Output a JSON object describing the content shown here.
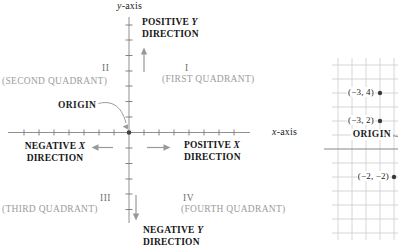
{
  "figure": "rectangular-coordinate-system-diagram",
  "colors": {
    "text": "#1c1c1c",
    "muted_label": "#9c9c9c",
    "numeral": "#6e6e6e",
    "axis_line": "#909090",
    "arrow": "#999999",
    "grid_line": "#cccccc",
    "grid_axis": "#888888",
    "point_dot": "#3a3a3a"
  },
  "axes": {
    "y_var": "y",
    "x_var": "x",
    "suffix": "-axis"
  },
  "origin": {
    "label": "ORIGIN"
  },
  "quadrants": [
    {
      "numeral": "I",
      "label": "(FIRST QUADRANT)"
    },
    {
      "numeral": "II",
      "label": "(SECOND QUADRANT)"
    },
    {
      "numeral": "III",
      "label": "(THIRD QUADRANT)"
    },
    {
      "numeral": "IV",
      "label": "(FOURTH QUADRANT)"
    }
  ],
  "directions": {
    "positive_y": {
      "prefix": "POSITIVE ",
      "var": "Y",
      "line2": "DIRECTION"
    },
    "negative_x": {
      "prefix": "NEGATIVE ",
      "var": "X",
      "line2": "DIRECTION"
    },
    "positive_x": {
      "prefix": "POSITIVE ",
      "var": "X",
      "line2": "DIRECTION"
    },
    "negative_y": {
      "prefix": "NEGATIVE ",
      "var": "Y",
      "line2": "DIRECTION"
    }
  },
  "grid": {
    "origin_label": "ORIGIN",
    "points": [
      {
        "label": "(−3, 4)",
        "coords": "(-3, 4)"
      },
      {
        "label": "(−3, 2)",
        "coords": "(-3, 2)"
      },
      {
        "label": "(−2, −2)",
        "coords": "(-2, -2)"
      }
    ]
  }
}
